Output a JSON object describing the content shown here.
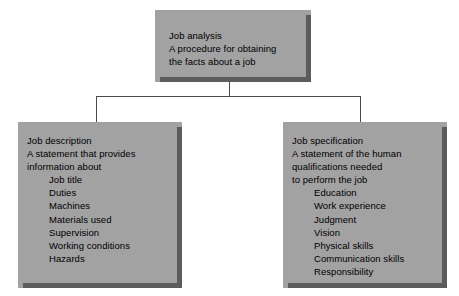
{
  "diagram": {
    "type": "hierarchy-tree",
    "colors": {
      "box_fill": "#a2a2a2",
      "box_shadow": "#5c5c5c",
      "text": "#000000",
      "connector": "#4a4a4a",
      "background": "#ffffff"
    },
    "nodes": {
      "root": {
        "heading": "Job analysis",
        "description_lines": [
          "A procedure for obtaining",
          "the facts about a job"
        ],
        "items": []
      },
      "left": {
        "heading": "Job description",
        "description_lines": [
          "A statement that provides",
          "information about"
        ],
        "items": [
          "Job title",
          "Duties",
          "Machines",
          "Materials used",
          "Supervision",
          "Working conditions",
          "Hazards"
        ]
      },
      "right": {
        "heading": "Job specification",
        "description_lines": [
          "A statement of the human",
          "qualifications needed",
          "to perform the job"
        ],
        "items": [
          "Education",
          "Work experience",
          "Judgment",
          "Vision",
          "Physical skills",
          "Communication skills",
          "Responsibility"
        ]
      }
    },
    "connectors": [
      {
        "name": "root-to-split",
        "from": "root",
        "to": "split-bar"
      },
      {
        "name": "split-to-left",
        "from": "split-bar",
        "to": "left"
      },
      {
        "name": "split-to-right",
        "from": "split-bar",
        "to": "right"
      }
    ]
  }
}
